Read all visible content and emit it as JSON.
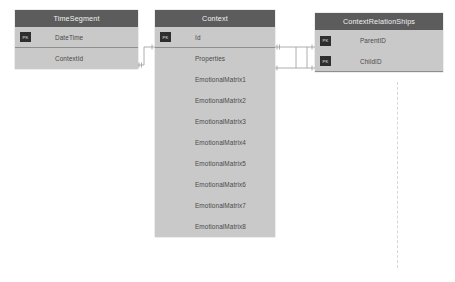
{
  "diagram": {
    "background_color": "#ffffff",
    "header_color": "#5c5c5c",
    "body_color": "#c9c9c9",
    "key_badge_color": "#2e2e2e",
    "connector_color": "#9a9a9a",
    "key_badge_label": "PK"
  },
  "entities": [
    {
      "id": "timesegment",
      "name": "TimeSegment",
      "attributes": [
        {
          "name": "DateTime",
          "key": "PK"
        },
        {
          "name": "ContextId",
          "key": ""
        }
      ]
    },
    {
      "id": "context",
      "name": "Context",
      "attributes": [
        {
          "name": "Id",
          "key": "PK"
        },
        {
          "name": "Properties",
          "key": ""
        },
        {
          "name": "EmotionalMatrix1",
          "key": ""
        },
        {
          "name": "EmotionalMatrix2",
          "key": ""
        },
        {
          "name": "EmotionalMatrix3",
          "key": ""
        },
        {
          "name": "EmotionalMatrix4",
          "key": ""
        },
        {
          "name": "EmotionalMatrix5",
          "key": ""
        },
        {
          "name": "EmotionalMatrix6",
          "key": ""
        },
        {
          "name": "EmotionalMatrix7",
          "key": ""
        },
        {
          "name": "EmotionalMatrix8",
          "key": ""
        }
      ]
    },
    {
      "id": "contextrelationships",
      "name": "ContextRelationShips",
      "attributes": [
        {
          "name": "ParentID",
          "key": "PK"
        },
        {
          "name": "ChildID",
          "key": "PK"
        }
      ]
    }
  ],
  "relationships": [
    {
      "from": "TimeSegment.ContextId",
      "to": "Context.Id"
    },
    {
      "from": "Context.Id",
      "to": "ContextRelationShips.ParentID"
    },
    {
      "from": "Context.Properties",
      "to": "ContextRelationShips.ChildID"
    }
  ]
}
